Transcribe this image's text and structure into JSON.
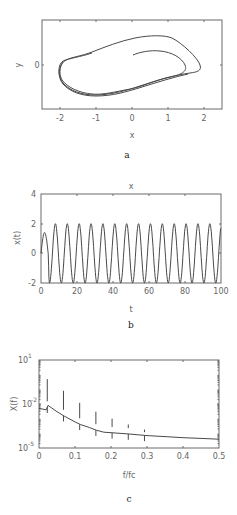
{
  "chart_data": [
    {
      "id": "a",
      "type": "line",
      "subtype": "phase-portrait",
      "title": "",
      "xlabel": "x",
      "ylabel": "y",
      "panel_label": "a",
      "xlim": [
        -2.5,
        2.5
      ],
      "ylim": [
        -1,
        1
      ],
      "xticks": [
        -2,
        -1,
        0,
        1,
        2
      ],
      "yticks": [
        0
      ],
      "grid": false,
      "description": "Limit-cycle trajectory spiraling outward from near (0,0.3) toward a closed orbit spanning x≈-2 to 2",
      "series": [
        {
          "name": "trajectory",
          "x": [
            0.0,
            0.4,
            0.8,
            1.2,
            1.45,
            1.5,
            1.3,
            0.9,
            0.3,
            -0.4,
            -1.0,
            -1.6,
            -1.95,
            -1.9,
            -1.6,
            -1.0,
            -0.3,
            0.4,
            1.0,
            1.6,
            1.95,
            2.0,
            1.8,
            1.4,
            0.9,
            0.3,
            -0.4,
            -1.0,
            -1.6,
            -1.95,
            -1.92,
            -1.5,
            -0.8,
            0.0,
            0.8,
            1.5,
            1.95
          ],
          "y": [
            0.25,
            0.32,
            0.35,
            0.28,
            0.15,
            0.0,
            -0.15,
            -0.28,
            -0.45,
            -0.62,
            -0.72,
            -0.62,
            -0.25,
            0.05,
            0.18,
            0.28,
            0.42,
            0.58,
            0.68,
            0.55,
            0.2,
            -0.05,
            -0.12,
            -0.22,
            -0.32,
            -0.48,
            -0.64,
            -0.74,
            -0.64,
            -0.28,
            0.03,
            0.17,
            0.27,
            0.4,
            0.6,
            0.62,
            0.2
          ]
        }
      ]
    },
    {
      "id": "b",
      "type": "line",
      "title": "x",
      "xlabel": "t",
      "ylabel": "x(t)",
      "panel_label": "b",
      "xlim": [
        0,
        100
      ],
      "ylim": [
        -2,
        4
      ],
      "xticks": [
        0,
        20,
        40,
        60,
        80,
        100
      ],
      "yticks": [
        -2,
        0,
        2,
        4
      ],
      "grid": false,
      "description": "Periodic oscillation between about -2 and 2, first peak ~1.4, period ~6.6",
      "series": [
        {
          "name": "x(t)",
          "period": 6.6,
          "amplitude": 2.0,
          "first_peak": 1.4,
          "peak_times": [
            2,
            8,
            14.6,
            21.2,
            27.8,
            34.4,
            41,
            47.6,
            54.2,
            60.8,
            67.4,
            74,
            80.6,
            87.2,
            93.8
          ],
          "peak_values": [
            1.4,
            2,
            2,
            2,
            2,
            2,
            2,
            2,
            2,
            2,
            2,
            2,
            2,
            2,
            2
          ]
        }
      ]
    },
    {
      "id": "c",
      "type": "line",
      "subtype": "spectrum",
      "title": "",
      "xlabel": "f/fc",
      "ylabel": "X(f)",
      "yscale": "log",
      "panel_label": "c",
      "xlim": [
        0,
        0.5
      ],
      "ylim": [
        1e-05,
        10
      ],
      "xticks": [
        0,
        0.1,
        0.2,
        0.3,
        0.4,
        0.5
      ],
      "yticks": [
        "10^-5",
        "10^-2",
        "10^1"
      ],
      "grid": false,
      "description": "Decaying spectrum with harmonic peaks at odd multiples of fundamental",
      "series": [
        {
          "name": "baseline",
          "x": [
            0,
            0.02,
            0.025,
            0.05,
            0.07,
            0.1,
            0.115,
            0.14,
            0.16,
            0.18,
            0.2,
            0.25,
            0.3,
            0.35,
            0.4,
            0.45,
            0.5
          ],
          "y": [
            0.005,
            0.004,
            0.008,
            0.003,
            0.0015,
            0.0006,
            0.0004,
            0.00025,
            0.00016,
            0.00012,
            0.00011,
            9e-05,
            7e-05,
            6e-05,
            5e-05,
            4.5e-05,
            4e-05
          ]
        },
        {
          "name": "peaks",
          "x": [
            0.023,
            0.068,
            0.113,
            0.158,
            0.203,
            0.248,
            0.293
          ],
          "y": [
            0.5,
            0.08,
            0.012,
            0.003,
            0.001,
            0.0004,
            0.00012
          ]
        }
      ]
    }
  ],
  "labels": {
    "a": {
      "panel": "a",
      "xlabel": "x",
      "ylabel": "y",
      "xticks": [
        "-2",
        "-1",
        "0",
        "1",
        "2"
      ],
      "yticks": [
        "0"
      ]
    },
    "b": {
      "panel": "b",
      "title": "x",
      "xlabel": "t",
      "ylabel": "x(t)",
      "xticks": [
        "0",
        "20",
        "40",
        "60",
        "80",
        "100"
      ],
      "yticks": [
        "4",
        "2",
        "0",
        "-2"
      ]
    },
    "c": {
      "panel": "c",
      "xlabel": "f/fc",
      "ylabel": "X(f)",
      "xticks": [
        "0",
        "0.1",
        "0.2",
        "0.3",
        "0.4",
        "0.5"
      ],
      "ytick_top": "10",
      "ytick_top_exp": "1",
      "ytick_mid": "10",
      "ytick_mid_exp": "-2",
      "ytick_bot": "10",
      "ytick_bot_exp": "-5"
    }
  }
}
